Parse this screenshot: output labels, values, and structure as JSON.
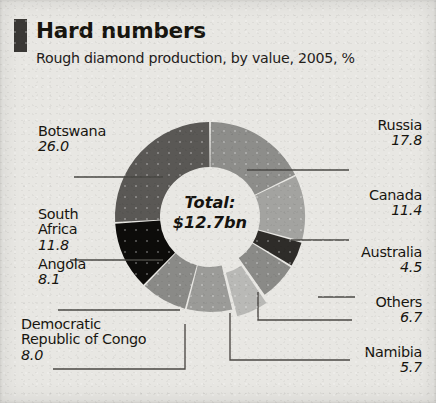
{
  "header": {
    "title": "Hard numbers",
    "subtitle": "Rough diamond production, by value, 2005, %",
    "marker_color": "#3b3936"
  },
  "center": {
    "label": "Total:",
    "value": "$12.7bn"
  },
  "chart_data": {
    "type": "pie",
    "variant": "donut",
    "title": "Hard numbers",
    "subtitle": "Rough diamond production, by value, 2005, %",
    "unit": "%",
    "total_label": "Total:",
    "total_value": "$12.7bn",
    "start_angle_deg": 0,
    "direction": "clockwise",
    "legend": "callout-labels",
    "grid": false,
    "categories": [
      "Botswana",
      "Russia",
      "Canada",
      "South Africa",
      "Angola",
      "Democratic Republic of Congo",
      "Others",
      "Namibia",
      "Australia"
    ],
    "values": [
      26.0,
      17.8,
      11.4,
      11.8,
      8.1,
      8.0,
      6.7,
      5.7,
      4.5
    ],
    "slices": [
      {
        "name": "Russia",
        "value": 17.8,
        "label": "17.8",
        "color": "#8d8d8a",
        "order": 1,
        "exploded": false
      },
      {
        "name": "Canada",
        "value": 11.4,
        "label": "11.4",
        "color": "#a3a3a0",
        "order": 2,
        "exploded": false
      },
      {
        "name": "Australia",
        "value": 4.5,
        "label": "4.5",
        "color": "#2e2c29",
        "order": 3,
        "exploded": false
      },
      {
        "name": "Others",
        "value": 6.7,
        "label": "6.7",
        "color": "#8a8a87",
        "order": 4,
        "exploded": false
      },
      {
        "name": "Namibia",
        "value": 5.7,
        "label": "5.7",
        "color": "#b9b9b6",
        "order": 5,
        "exploded": true
      },
      {
        "name": "Democratic Republic of Congo",
        "value": 8.0,
        "label": "8.0",
        "color": "#9b9b98",
        "order": 6,
        "exploded": false
      },
      {
        "name": "Angola",
        "value": 8.1,
        "label": "8.1",
        "color": "#8a8a87",
        "order": 7,
        "exploded": false
      },
      {
        "name": "South Africa",
        "value": 11.8,
        "label": "11.8",
        "color": "#0d0c0a",
        "order": 8,
        "exploded": false
      },
      {
        "name": "Botswana",
        "value": 26.0,
        "label": "26.0",
        "color": "#5a5855",
        "order": 9,
        "exploded": false
      }
    ]
  },
  "callouts": {
    "botswana": {
      "name": "Botswana",
      "value": "26.0"
    },
    "south_africa_l1": "South",
    "south_africa_l2": "Africa",
    "south_africa_value": "11.8",
    "angola": {
      "name": "Angola",
      "value": "8.1"
    },
    "drc_l1": "Democratic",
    "drc_l2": "Republic of Congo",
    "drc_value": "8.0",
    "russia": {
      "name": "Russia",
      "value": "17.8"
    },
    "canada": {
      "name": "Canada",
      "value": "11.4"
    },
    "australia": {
      "name": "Australia",
      "value": "4.5"
    },
    "others": {
      "name": "Others",
      "value": "6.7"
    },
    "namibia": {
      "name": "Namibia",
      "value": "5.7"
    }
  }
}
